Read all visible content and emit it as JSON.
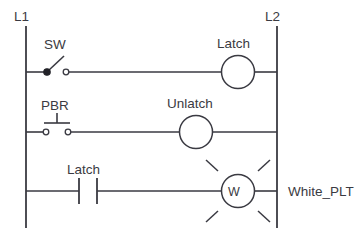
{
  "diagram": {
    "kind": "ladder-logic-diagram",
    "title": "",
    "line_color": "#3a3a42",
    "background_color": "#ffffff",
    "rails": {
      "left": {
        "label": "L1"
      },
      "right": {
        "label": "L2"
      }
    },
    "rungs": [
      {
        "id": "rung-1",
        "input": {
          "label": "SW",
          "type": "selector-switch",
          "state": "open"
        },
        "output": {
          "label": "Latch",
          "type": "coil",
          "letter": ""
        }
      },
      {
        "id": "rung-2",
        "input": {
          "label": "PBR",
          "type": "pushbutton-normally-open",
          "state": "open"
        },
        "output": {
          "label": "Unlatch",
          "type": "coil",
          "letter": ""
        }
      },
      {
        "id": "rung-3",
        "input": {
          "label": "Latch",
          "type": "contact-normally-open",
          "state": "open"
        },
        "output": {
          "label": "White_PLT",
          "type": "pilot-light",
          "letter": "W"
        }
      }
    ]
  }
}
